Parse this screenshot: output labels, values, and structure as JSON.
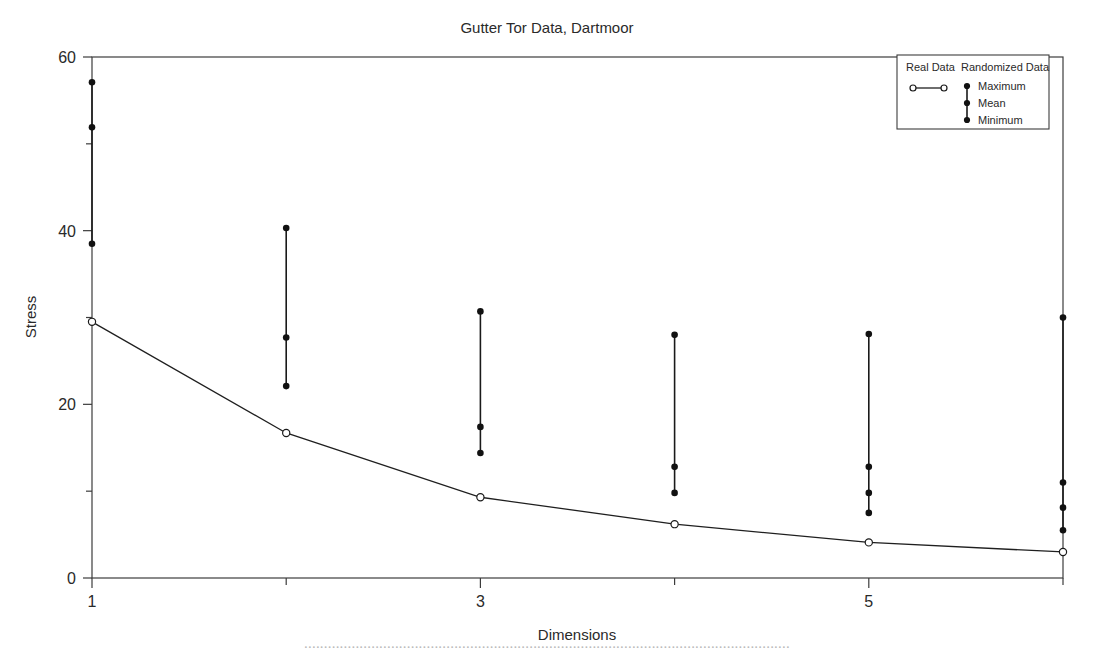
{
  "chart_data": {
    "type": "line",
    "title": "Gutter Tor Data, Dartmoor",
    "xlabel": "Dimensions",
    "ylabel": "Stress",
    "xlim": [
      1,
      6
    ],
    "ylim": [
      0,
      60
    ],
    "grid": false,
    "x_ticks": [
      1,
      2,
      3,
      4,
      5,
      6
    ],
    "x_tick_labels": [
      "1",
      "",
      "3",
      "",
      "5",
      ""
    ],
    "y_ticks": [
      0,
      10,
      20,
      30,
      40,
      50,
      60
    ],
    "y_tick_labels": [
      "0",
      "",
      "20",
      "",
      "40",
      "",
      "60"
    ],
    "legend_position": "top-right",
    "legend_groups": [
      {
        "header": "Real Data",
        "marker": "open-circle-line"
      },
      {
        "header": "Randomized Data",
        "marker": "filled-dot-range",
        "items": [
          "Maximum",
          "Mean",
          "Minimum"
        ]
      }
    ],
    "x": [
      1,
      2,
      3,
      4,
      5,
      6
    ],
    "series": [
      {
        "name": "Real Data",
        "marker": "open-circle",
        "values": [
          29.5,
          16.7,
          9.3,
          6.2,
          4.1,
          3.0
        ]
      },
      {
        "name": "Randomized Data Maximum",
        "marker": "filled-dot",
        "values": [
          57.1,
          40.3,
          30.7,
          28.0,
          28.1,
          30.0
        ]
      },
      {
        "name": "Randomized Data Mean",
        "marker": "filled-dot",
        "values": [
          51.9,
          27.7,
          17.4,
          12.8,
          12.8,
          11.0
        ]
      },
      {
        "name": "Randomized Data Intermediate",
        "marker": "filled-dot",
        "values": [
          null,
          null,
          null,
          null,
          9.8,
          8.1
        ]
      },
      {
        "name": "Randomized Data Minimum",
        "marker": "filled-dot",
        "values": [
          38.5,
          22.1,
          14.4,
          9.8,
          7.5,
          5.5
        ]
      }
    ]
  },
  "caption": {
    "text": "..........................................................................................................................."
  }
}
